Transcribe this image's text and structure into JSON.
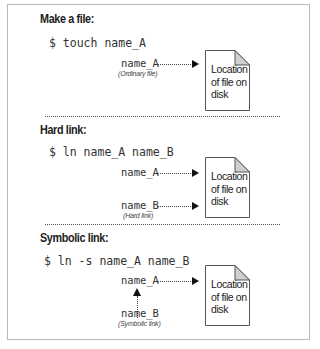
{
  "sections": [
    {
      "heading": "Make a file:",
      "command": "$ touch name_A",
      "names": [
        {
          "label": "name_A",
          "caption": "(Ordinary file)"
        }
      ],
      "file_label": "Location of file on disk"
    },
    {
      "heading": "Hard link:",
      "command": "$ ln name_A name_B",
      "names": [
        {
          "label": "name_A",
          "caption": ""
        },
        {
          "label": "name_B",
          "caption": "(Hard link)"
        }
      ],
      "file_label": "Location of file on disk"
    },
    {
      "heading": "Symbolic link:",
      "command": "$ ln -s name_A name_B",
      "names": [
        {
          "label": "name_A",
          "caption": ""
        },
        {
          "label": "name_B",
          "caption": "(Symbolic link)"
        }
      ],
      "file_label": "Location of file on disk"
    }
  ],
  "colors": {
    "frame_border": "#b9b9b9",
    "file_corner_fold": "#d0d0d0",
    "arrow": "#111111"
  }
}
